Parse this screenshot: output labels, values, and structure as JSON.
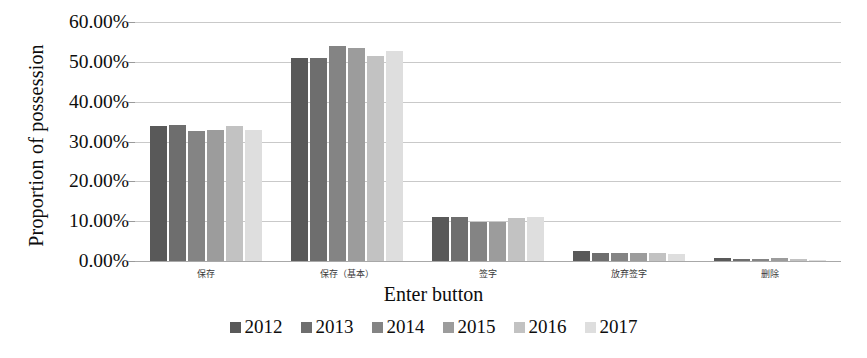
{
  "chart_data": {
    "type": "bar",
    "title": "",
    "xlabel": "Enter button",
    "ylabel": "Proportion of possession",
    "categories": [
      "保存",
      "保存（基本）",
      "签字",
      "放弃签字",
      "删除"
    ],
    "ylim": [
      0,
      60
    ],
    "ytick_labels": [
      "0.00%",
      "10.00%",
      "20.00%",
      "30.00%",
      "40.00%",
      "50.00%",
      "60.00%"
    ],
    "ytick_values": [
      0,
      10,
      20,
      30,
      40,
      50,
      60
    ],
    "grid": true,
    "legend_position": "bottom",
    "series": [
      {
        "name": "2012",
        "color": "#595959",
        "values": [
          34.0,
          51.0,
          11.0,
          2.4,
          0.7
        ]
      },
      {
        "name": "2013",
        "color": "#6e6e6e",
        "values": [
          34.1,
          51.0,
          11.0,
          2.0,
          0.6
        ]
      },
      {
        "name": "2014",
        "color": "#848484",
        "values": [
          32.6,
          54.0,
          9.7,
          1.9,
          0.5
        ]
      },
      {
        "name": "2015",
        "color": "#9c9c9c",
        "values": [
          32.8,
          53.4,
          9.8,
          1.9,
          0.8
        ]
      },
      {
        "name": "2016",
        "color": "#c2c2c2",
        "values": [
          34.0,
          51.5,
          10.7,
          1.9,
          0.4
        ]
      },
      {
        "name": "2017",
        "color": "#dedede",
        "values": [
          32.8,
          52.6,
          11.0,
          1.7,
          0.3
        ]
      }
    ]
  }
}
